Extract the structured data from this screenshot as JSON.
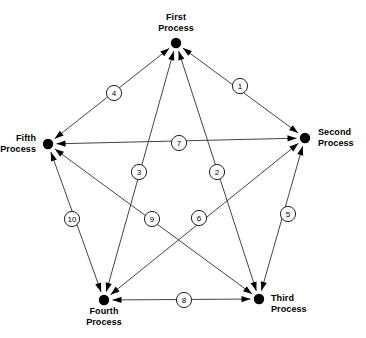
{
  "diagram": {
    "type": "directed-graph-pentagon",
    "title": "",
    "background_color": "#ffffff",
    "node_color": "#000000",
    "edge_color": "#444444",
    "label_circle_fill": "#ffffff",
    "label_circle_stroke": "#222222",
    "nodes": [
      {
        "id": "first",
        "label_line1": "First",
        "label_line2": "Process",
        "x": 176,
        "y": 43
      },
      {
        "id": "second",
        "label_line1": "Second",
        "label_line2": "Process",
        "x": 305,
        "y": 138
      },
      {
        "id": "third",
        "label_line1": "Third",
        "label_line2": "Process",
        "x": 259,
        "y": 299
      },
      {
        "id": "fourth",
        "label_line1": "Fourth",
        "label_line2": "Process",
        "x": 104,
        "y": 300
      },
      {
        "id": "fifth",
        "label_line1": "Fifth",
        "label_line2": "Process",
        "x": 48,
        "y": 144
      }
    ],
    "edges": [
      {
        "id": "e1",
        "label": "1",
        "from": "first",
        "to": "second",
        "bidirectional": true,
        "label_x": 240,
        "label_y": 86
      },
      {
        "id": "e2",
        "label": "2",
        "from": "first",
        "to": "third",
        "bidirectional": true,
        "label_x": 217,
        "label_y": 172
      },
      {
        "id": "e3",
        "label": "3",
        "from": "first",
        "to": "fourth",
        "bidirectional": true,
        "label_x": 139,
        "label_y": 172
      },
      {
        "id": "e4",
        "label": "4",
        "from": "first",
        "to": "fifth",
        "bidirectional": true,
        "label_x": 114,
        "label_y": 93
      },
      {
        "id": "e5",
        "label": "5",
        "from": "second",
        "to": "third",
        "bidirectional": true,
        "label_x": 288,
        "label_y": 214
      },
      {
        "id": "e6",
        "label": "6",
        "from": "second",
        "to": "fourth",
        "bidirectional": true,
        "label_x": 199,
        "label_y": 218
      },
      {
        "id": "e7",
        "label": "7",
        "from": "second",
        "to": "fifth",
        "bidirectional": true,
        "label_x": 179,
        "label_y": 143
      },
      {
        "id": "e8",
        "label": "8",
        "from": "third",
        "to": "fourth",
        "bidirectional": true,
        "label_x": 184,
        "label_y": 300
      },
      {
        "id": "e9",
        "label": "9",
        "from": "third",
        "to": "fifth",
        "bidirectional": true,
        "label_x": 152,
        "label_y": 219
      },
      {
        "id": "e10",
        "label": "10",
        "from": "fourth",
        "to": "fifth",
        "bidirectional": true,
        "label_x": 72,
        "label_y": 219
      }
    ]
  }
}
